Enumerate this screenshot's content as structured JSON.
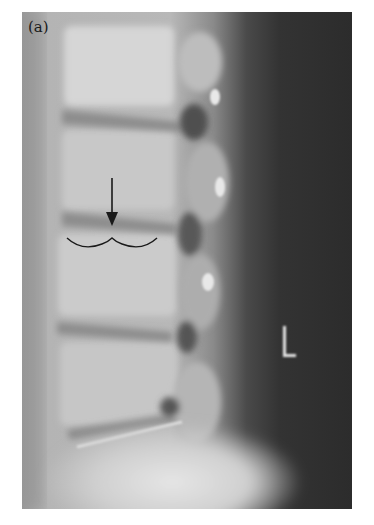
{
  "figure": {
    "panel_label": "(a)",
    "side_marker": "L",
    "type": "lateral lumbar spine radiograph",
    "annotations": [
      {
        "kind": "arrow",
        "direction": "down",
        "color": "#1a1a1a"
      },
      {
        "kind": "curly-brace",
        "orientation": "horizontal",
        "color": "#1a1a1a"
      }
    ],
    "colors": {
      "page_background": "#ffffff",
      "soft_tissue_dark": "#2f2f2f",
      "bone_light": "#d8d8d8"
    }
  }
}
